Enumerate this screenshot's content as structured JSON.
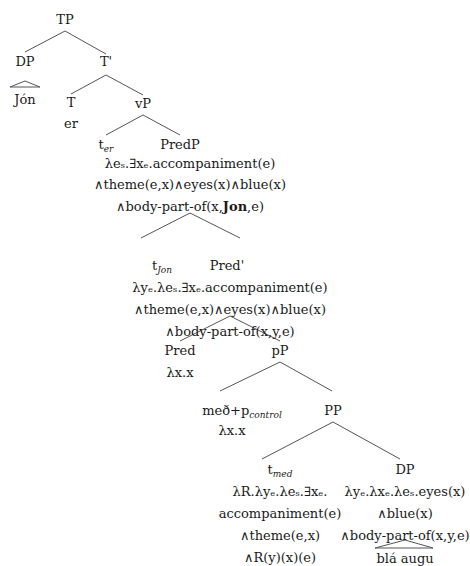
{
  "tree": {
    "TP": "TP",
    "DP_subj": "DP",
    "Jon": "Jón",
    "Tbar": "T'",
    "T": "T",
    "er": "er",
    "vP": "vP",
    "t_er": {
      "base": "t",
      "sub": "er"
    },
    "PredP": {
      "label": "PredP",
      "sem": [
        "λeₛ.∃xₑ.accompaniment(e)",
        "∧theme(e,x)∧eyes(x)∧blue(x)",
        "∧body-part-of(x,"
      ],
      "bold_arg": "Jon",
      "sem_tail": ",e)"
    },
    "t_Jon": {
      "base": "t",
      "sub": "Jon"
    },
    "Predbar": {
      "label": "Pred'",
      "sem": [
        "λyₑ.λeₛ.∃xₑ.accompaniment(e)",
        "∧theme(e,x)∧eyes(x)∧blue(x)",
        "∧body-part-of(x,y,e)"
      ]
    },
    "Pred": {
      "label": "Pred",
      "sem": "λx.x"
    },
    "pP": "pP",
    "med_p": {
      "base": "með+p",
      "sub": "control",
      "sem": "λx.x"
    },
    "PP": "PP",
    "t_med": {
      "base": "t",
      "sub": "med",
      "sem": [
        "λR.λyₑ.λeₛ.∃xₑ.",
        "accompaniment(e)",
        "∧theme(e,x)",
        "∧R(y)(x)(e)"
      ]
    },
    "DP_obj": {
      "label": "DP",
      "sem": [
        "λyₑ.λxₑ.λeₛ.eyes(x)",
        "∧blue(x)",
        "∧body-part-of(x,y,e)"
      ]
    },
    "bla_augu": "blá augu"
  }
}
